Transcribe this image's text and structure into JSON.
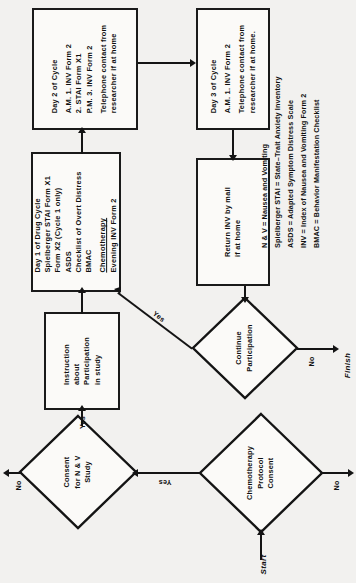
{
  "figure": {
    "orientation": "rotated-90-ccw",
    "ink_color": "#141414",
    "paper_color": "#f2f1ef"
  },
  "terminals": {
    "start": "Start",
    "finish": "Finish"
  },
  "nodes": {
    "day2": {
      "id": "day2-of-cycle",
      "shape": "process",
      "lines": [
        "Day 2 of Cycle",
        "A.M.   1.   INV Form 2",
        "          2.   STAI Form X1",
        "P.M.   3.   INV Form 2",
        "Telephone contact from",
        "researcher if at home"
      ]
    },
    "day1": {
      "id": "day1-of-drug-cycle",
      "shape": "process",
      "lines": [
        "Day 1 of Drug Cycle",
        "Spielberger STAI Form X1",
        "   Form X2 (Cycle 1 only)",
        "ASDS",
        "Checklist of Overt Distress",
        "BMAC",
        "Chemotherapy",
        "Evening INV Form 2"
      ],
      "underlined_line": "Chemotherapy"
    },
    "day3": {
      "id": "day3-of-cycle",
      "shape": "process",
      "lines": [
        "Day 3 of Cycle",
        "A.M.   1.   INV Form 2",
        "Telephone contact from",
        "researcher if at home."
      ]
    },
    "return_inv": {
      "id": "return-inv-by-mail",
      "shape": "process",
      "lines": [
        "Return INV by mail",
        "if at home"
      ]
    },
    "instruction": {
      "id": "instruction-about-participation",
      "shape": "process",
      "lines": [
        "Instruction",
        "about",
        "Participation",
        "in study"
      ]
    },
    "consent_nv": {
      "id": "consent-for-nv-study",
      "shape": "decision",
      "lines": [
        "Consent",
        "for  N & V",
        "Study"
      ]
    },
    "chemo_consent": {
      "id": "chemotherapy-protocol-consent",
      "shape": "decision",
      "lines": [
        "Chemotherapy",
        "Protocol",
        "Consent"
      ]
    },
    "continue_participation": {
      "id": "continue-participation",
      "shape": "decision",
      "lines": [
        "Continue",
        "Participation"
      ]
    }
  },
  "edge_labels": {
    "chemo_consent_yes": "Yes",
    "chemo_consent_no": "No",
    "consent_nv_yes": "Yes",
    "consent_nv_no": "No",
    "continue_yes": "Yes",
    "continue_no": "No"
  },
  "legend": {
    "entries": [
      "N & V = Nausea and Vomiting",
      "Spielberger STAI = State–Trait Anxiety Inventory",
      "ASDS = Adapted Symptom Distress Scale",
      "INV = Index of Nausea and Vomiting Form 2",
      "BMAC = Behavior Manifestation Checklist"
    ]
  }
}
